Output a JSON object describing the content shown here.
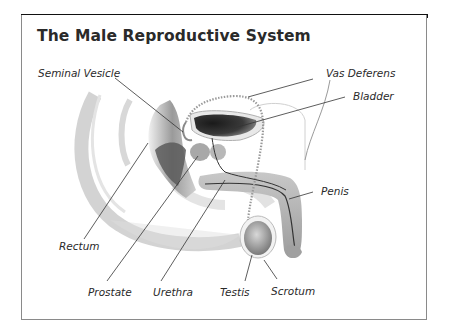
{
  "diagram": {
    "title": "The Male Reproductive System",
    "labels": {
      "seminal_vesicle": "Seminal Vesicle",
      "vas_deferens": "Vas Deferens",
      "bladder": "Bladder",
      "penis": "Penis",
      "rectum": "Rectum",
      "prostate": "Prostate",
      "urethra": "Urethra",
      "testis": "Testis",
      "scrotum": "Scrotum"
    },
    "colors": {
      "title_bar": "#111111",
      "border": "#8a8a8a",
      "text": "#2a2a2a",
      "tissue": "#b8b8b8",
      "dark_tissue": "#3a3a3a"
    }
  }
}
